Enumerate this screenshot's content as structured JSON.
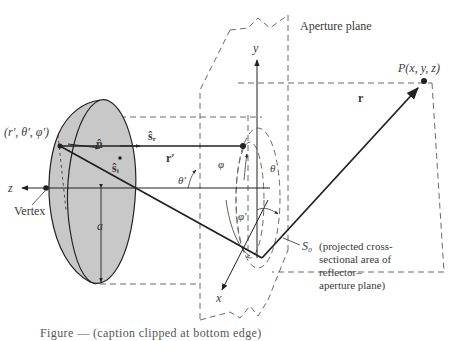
{
  "figure": {
    "labels": {
      "aperture_plane": "Aperture plane",
      "point_p": "P(x, y, z)",
      "reflector_point": "(r′, θ′, φ′)",
      "unit_normal": "n̂",
      "incident_dir": "ŝᵢ",
      "reflected_dir": "ŝᵣ",
      "r_prime": "r′",
      "r_vec": "r",
      "theta_prime": "θ′",
      "theta": "θ",
      "phi": "φ",
      "phi_prime": "φ′",
      "z_axis": "z",
      "y_axis": "y",
      "x_axis": "x",
      "vertex": "Vertex",
      "radius_a": "a",
      "s0_symbol": "S₀",
      "s0_desc_line1": "(projected cross-",
      "s0_desc_line2": "sectional area of",
      "s0_desc_line3": "reflector–",
      "s0_desc_line4": "aperture plane)"
    },
    "caption_partial": "Figure — (caption clipped at bottom edge)"
  },
  "colors": {
    "reflector_fill": "#c8c8c8",
    "line": "#2a2a2a",
    "dashed": "#6a6a6a",
    "background": "#ffffff"
  }
}
